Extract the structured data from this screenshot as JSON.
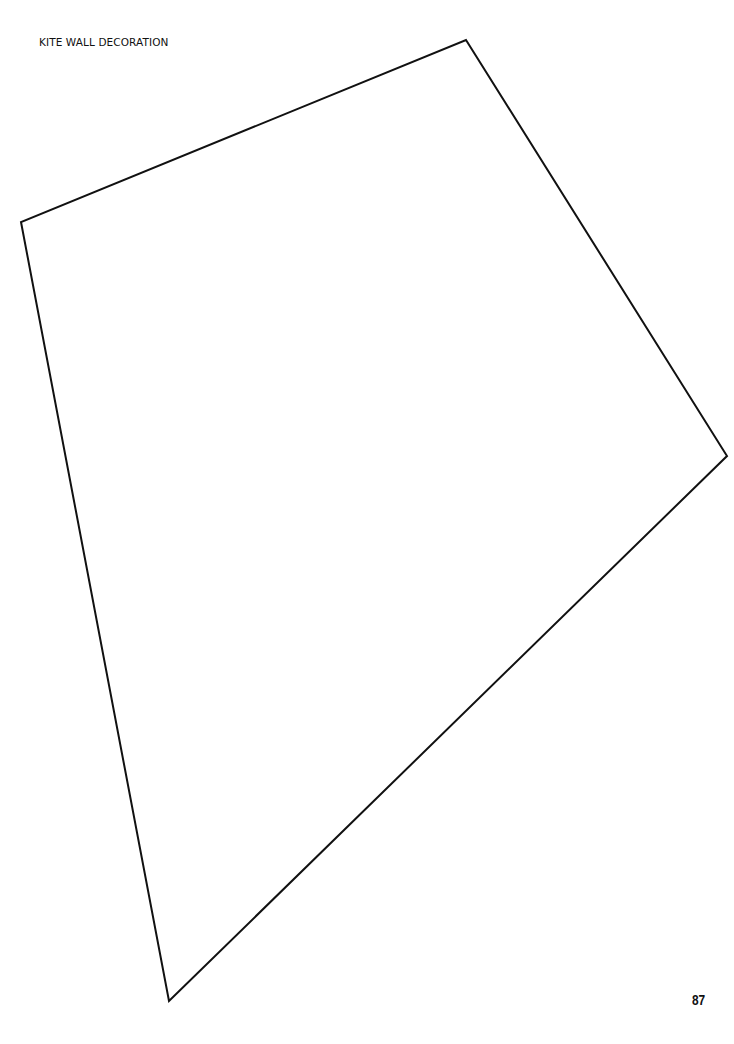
{
  "document": {
    "title": "KITE WALL DECORATION",
    "page_number": "87"
  },
  "figure": {
    "shape": "kite-outline",
    "stroke_color": "#111111",
    "fill_color": "#ffffff",
    "vertices": [
      {
        "name": "top",
        "x": 466,
        "y": 40
      },
      {
        "name": "right",
        "x": 727,
        "y": 456
      },
      {
        "name": "bottom",
        "x": 169,
        "y": 1001
      },
      {
        "name": "left",
        "x": 21,
        "y": 222
      }
    ]
  }
}
